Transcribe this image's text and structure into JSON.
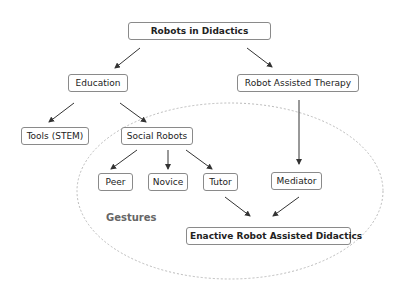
{
  "diagram": {
    "nodes": {
      "root": "Robots in Didactics",
      "education": "Education",
      "therapy": "Robot Assisted Therapy",
      "tools": "Tools (STEM)",
      "social": "Social Robots",
      "peer": "Peer",
      "novice": "Novice",
      "tutor": "Tutor",
      "mediator": "Mediator",
      "enactive": "Enactive Robot Assisted Didactics"
    },
    "region_label": "Gestures",
    "colors": {
      "border": "#8a8a8a",
      "arrow": "#333333",
      "ellipse": "#bbbbbb",
      "gesture_text": "#666666"
    }
  }
}
